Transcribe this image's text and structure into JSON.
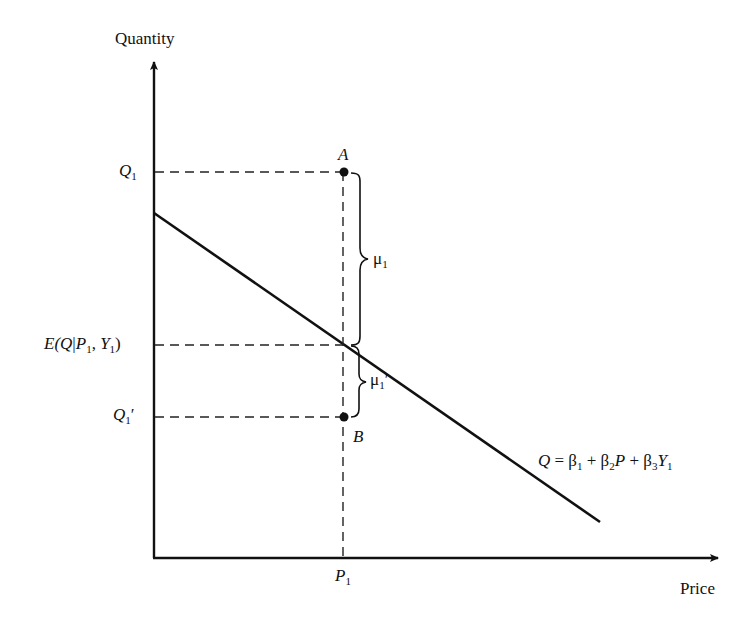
{
  "axes": {
    "y_label": "Quantity",
    "x_label": "Price"
  },
  "ticks": {
    "q1": {
      "main": "Q",
      "sub": "1"
    },
    "expected": {
      "pre": "E(",
      "q": "Q",
      "bar": "|",
      "p": "P",
      "psub": "1",
      "comma": ", ",
      "y": "Y",
      "ysub": "1",
      "post": ")"
    },
    "q1prime": {
      "main": "Q",
      "sub": "1",
      "prime": "′"
    },
    "p1": {
      "main": "P",
      "sub": "1"
    }
  },
  "points": {
    "a": "A",
    "b": "B"
  },
  "braces": {
    "mu1": {
      "main": "μ",
      "sub": "1"
    },
    "mu1prime": {
      "main": "μ",
      "sub": "1",
      "prime": "′"
    }
  },
  "equation": {
    "q": "Q",
    "eq": " = β",
    "b1sub": "1",
    "plus1": " + β",
    "b2sub": "2",
    "p": "P",
    "plus2": " + β",
    "b3sub": "3",
    "y": "Y",
    "ysub": "1"
  },
  "colors": {
    "line": "#111111",
    "background": "#ffffff"
  }
}
